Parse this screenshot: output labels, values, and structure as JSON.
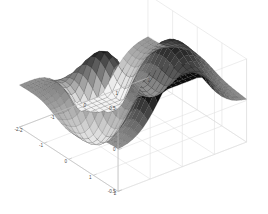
{
  "figure": {
    "background_color": "#ffffff",
    "axis_line_color": "#bdbdbd",
    "grid_color": "#dedede",
    "tick_text_color": "#4a4a4a"
  },
  "chart_data": {
    "type": "surface",
    "title": "",
    "xlabel": "",
    "ylabel": "",
    "zlabel": "",
    "grid": true,
    "legend": "none",
    "colormap": "gray",
    "mesh": true,
    "projection": "3d-perspective",
    "xlim": [
      -2,
      2
    ],
    "ylim": [
      -2,
      2
    ],
    "zlim": [
      -0.5,
      0.5
    ],
    "x_ticks": [
      -2,
      -1,
      0,
      1,
      2
    ],
    "x_tick_labels": [
      "-2",
      "-1",
      "0",
      "1",
      "2"
    ],
    "y_ticks": [
      2,
      1,
      0,
      -1,
      -2
    ],
    "y_tick_labels": [
      "2",
      "1",
      "0",
      "-1",
      "-2"
    ],
    "z_ticks": [
      0.5,
      0,
      -0.5
    ],
    "z_tick_labels": [
      "0.5",
      "0",
      "-0.5"
    ],
    "grid_n": 26,
    "surface_description": "Saddle-like peaks surface: a tall dark crest at the back-right, a deep dark trough at the front-center-left, a light lobe on the right flank, flattening to a mid-gray plane at z=0 toward the outer edges.",
    "z_min_value": -0.5,
    "z_max_value": 0.5,
    "view_azimuth": -37.5,
    "view_elevation": 30
  }
}
